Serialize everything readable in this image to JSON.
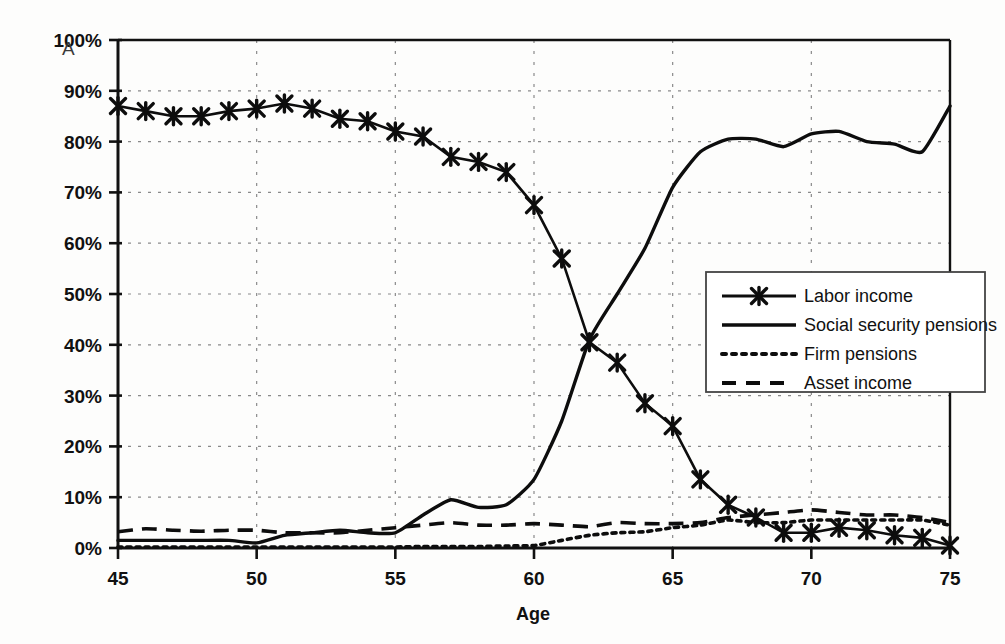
{
  "panel": {
    "label": "A"
  },
  "chart_data": {
    "type": "line",
    "title": "",
    "xlabel": "Age",
    "ylabel": "",
    "xlim": [
      45,
      75
    ],
    "ylim": [
      0,
      100
    ],
    "xticks": [
      45,
      50,
      55,
      60,
      65,
      70,
      75
    ],
    "xtick_labels": [
      "45",
      "50",
      "55",
      "60",
      "65",
      "70",
      "75"
    ],
    "yticks": [
      0,
      10,
      20,
      30,
      40,
      50,
      60,
      70,
      80,
      90,
      100
    ],
    "ytick_labels": [
      "0%",
      "10%",
      "20%",
      "30%",
      "40%",
      "50%",
      "60%",
      "70%",
      "80%",
      "90%",
      "100%"
    ],
    "grid": true,
    "grid_style": "dotted",
    "legend_position": "center-right",
    "x": [
      45,
      46,
      47,
      48,
      49,
      50,
      51,
      52,
      53,
      54,
      55,
      56,
      57,
      58,
      59,
      60,
      61,
      62,
      63,
      64,
      65,
      66,
      67,
      68,
      69,
      70,
      71,
      72,
      73,
      74,
      75
    ],
    "series": [
      {
        "name": "Labor income",
        "style": "solid-with-x-markers",
        "marker": "x",
        "values": [
          87,
          86,
          85,
          85,
          86,
          86.5,
          87.5,
          86.5,
          84.5,
          84,
          82,
          81,
          77,
          76,
          74,
          67.5,
          57,
          40.5,
          36.5,
          28.5,
          24,
          13.5,
          8.5,
          6,
          3,
          3,
          4,
          3.5,
          2.5,
          2,
          0.5
        ]
      },
      {
        "name": "Social security pensions",
        "style": "solid",
        "marker": "none",
        "values": [
          1.5,
          1.5,
          1.5,
          1.5,
          1.5,
          1,
          2.5,
          3,
          3.5,
          3,
          3,
          6.5,
          9.5,
          8,
          8.5,
          13.5,
          25,
          41,
          50,
          59,
          71,
          78,
          80.5,
          80.5,
          79,
          81.5,
          82,
          80,
          79.5,
          78,
          87
        ]
      },
      {
        "name": "Firm pensions",
        "style": "dotted",
        "marker": "none",
        "values": [
          0.2,
          0.2,
          0.2,
          0.2,
          0.2,
          0.2,
          0.2,
          0.2,
          0.2,
          0.2,
          0.2,
          0.3,
          0.3,
          0.3,
          0.4,
          0.5,
          1.5,
          2.5,
          3,
          3.2,
          4,
          4.5,
          5.5,
          5,
          5,
          5.5,
          5.5,
          5.5,
          5.5,
          5.5,
          4.5
        ]
      },
      {
        "name": "Asset income",
        "style": "dashed",
        "marker": "none",
        "values": [
          3.2,
          3.8,
          3.5,
          3.3,
          3.5,
          3.5,
          3,
          3,
          3,
          3.5,
          4,
          4.5,
          5,
          4.5,
          4.5,
          4.8,
          4.5,
          4.2,
          5,
          4.8,
          4.8,
          5,
          6,
          6.5,
          7,
          7.5,
          7,
          6.5,
          6.5,
          6,
          5
        ]
      }
    ]
  },
  "legend": {
    "items": [
      {
        "label": "Labor income",
        "style": "solid-with-x-markers"
      },
      {
        "label": "Social security pensions",
        "style": "solid"
      },
      {
        "label": "Firm pensions",
        "style": "dotted"
      },
      {
        "label": "Asset income",
        "style": "dashed"
      }
    ]
  }
}
